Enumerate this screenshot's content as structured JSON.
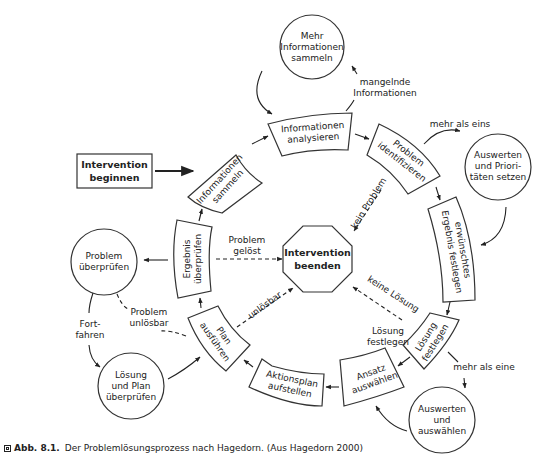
{
  "diagram": {
    "start": "Intervention beginnen",
    "end": "Intervention beenden",
    "cycle_steps": [
      {
        "id": "informationen-sammeln",
        "label": "Informationen sammeln"
      },
      {
        "id": "informationen-analysieren",
        "label": "Informationen analysieren"
      },
      {
        "id": "problem-identifizieren",
        "label": "Problem identifizieren"
      },
      {
        "id": "erwuenschtes-ergebnis-festlegen",
        "label": "erwünschtes Ergebnis festlegen"
      },
      {
        "id": "loesung-festlegen",
        "label": "Lösung festlegen"
      },
      {
        "id": "ansatz-auswaehlen",
        "label": "Ansatz auswählen"
      },
      {
        "id": "aktionsplan-aufstellen",
        "label": "Aktionsplan aufstellen"
      },
      {
        "id": "plan-ausfuehren",
        "label": "Plan ausführen"
      },
      {
        "id": "ergebnis-ueberpruefen",
        "label": "Ergebnis überprüfen"
      }
    ],
    "side_nodes": {
      "mehr_informationen": "Mehr Informationen sammeln",
      "auswerten_prioritaeten": "Auswerten und Priori-täten setzen",
      "auswerten_auswaehlen": "Auswerten und auswählen",
      "problem_ueberpruefen": "Problem überprüfen",
      "loesung_plan_ueberpruefen": "Lösung und Plan überprüfen"
    },
    "edge_labels": {
      "mangelnde_informationen": "mangelnde Informationen",
      "mehr_als_eins": "mehr als eins",
      "mehr_als_eine": "mehr als eine",
      "kein_problem": "kein Problem",
      "keine_loesung": "keine Lösung",
      "loesung_festlegen": "Lösung festlegen",
      "problem_geloest": "Problem gelöst",
      "unloesbar": "unlösbar",
      "problem_unloesbar": "Problem unlösbar",
      "fortfahren": "Fort-fahren"
    }
  },
  "lines": {
    "start": [
      "Intervention",
      "beginnen"
    ],
    "end": [
      "Intervention",
      "beenden"
    ],
    "informationen_sammeln": [
      "Informationen",
      "sammeln"
    ],
    "informationen_analysieren": [
      "Informationen",
      "analysieren"
    ],
    "problem_identifizieren": [
      "Problem",
      "identifizieren"
    ],
    "ergebnis_festlegen": [
      "erwünschtes",
      "Ergebnis festlegen"
    ],
    "loesung_festlegen_box": [
      "Lösung",
      "festlegen"
    ],
    "ansatz_auswaehlen": [
      "Ansatz",
      "auswählen"
    ],
    "aktionsplan_aufstellen": [
      "Aktionsplan",
      "aufstellen"
    ],
    "plan_ausfuehren": [
      "Plan",
      "ausführen"
    ],
    "ergebnis_ueberpruefen": [
      "Ergebnis",
      "überprüfen"
    ],
    "mehr_informationen": [
      "Mehr",
      "Informationen",
      "sammeln"
    ],
    "auswerten_prioritaeten": [
      "Auswerten",
      "und Priori-",
      "täten setzen"
    ],
    "auswerten_auswaehlen": [
      "Auswerten",
      "und",
      "auswählen"
    ],
    "problem_ueberpruefen": [
      "Problem",
      "überprüfen"
    ],
    "loesung_plan_ueberpruefen": [
      "Lösung",
      "und Plan",
      "überprüfen"
    ],
    "mangelnde_informationen": [
      "mangelnde",
      "Informationen"
    ],
    "mehr_als_eins": [
      "mehr als eins"
    ],
    "mehr_als_eine": [
      "mehr als eine"
    ],
    "kein_problem": [
      "kein Problem"
    ],
    "keine_loesung": [
      "keine Lösung"
    ],
    "loesung_festlegen_label": [
      "Lösung",
      "festlegen"
    ],
    "problem_geloest": [
      "Problem",
      "gelöst"
    ],
    "unloesbar": [
      "unlösbar"
    ],
    "problem_unloesbar": [
      "Problem",
      "unlösbar"
    ],
    "fortfahren": [
      "Fort-",
      "fahren"
    ]
  },
  "caption": {
    "label": "Abb. 8.1.",
    "text": "Der Problemlösungsprozess nach Hagedorn. (Aus Hagedorn 2000)"
  }
}
